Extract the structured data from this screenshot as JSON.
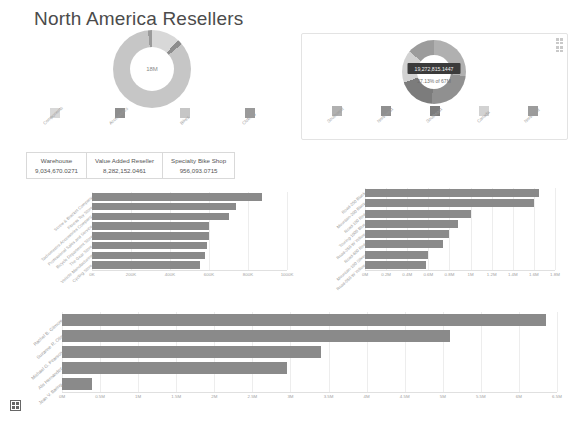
{
  "page": {
    "title": "North America Resellers",
    "background": "#ffffff"
  },
  "colors": {
    "bar": "#8a8a8a",
    "bar_light": "#b9b9b9",
    "donut_main": "#bdbdbd",
    "donut_accent": "#8a8a8a",
    "tooltip_bg": "#3b3b3b",
    "text": "#5a5a5a",
    "muted": "#9b9b9b",
    "grid": "#ededed"
  },
  "left_donut": {
    "center_label": "18M",
    "legend": [
      {
        "label": "Components",
        "color": "#d8d8d8"
      },
      {
        "label": "Accessories",
        "color": "#8e8e8e"
      },
      {
        "label": "Bikes",
        "color": "#c6c6c6"
      },
      {
        "label": "Clothing",
        "color": "#9a9a9a"
      }
    ],
    "chart_data": {
      "type": "pie",
      "title": "",
      "categories": [
        "Components",
        "Accessories",
        "Bikes",
        "Clothing"
      ],
      "values": [
        2.1,
        0.4,
        15.2,
        0.3
      ],
      "center_total": "18M",
      "legend_position": "bottom"
    }
  },
  "right_panel": {
    "tooltip_value": "19,272,815.1447",
    "tooltip_sub": "27.13% of 67M",
    "corner_icons": [
      "grid-icon",
      "grid-icon"
    ],
    "legend": [
      {
        "label": "Southwest",
        "color": "#b0b0b0"
      },
      {
        "label": "Northwest",
        "color": "#909090"
      },
      {
        "label": "Southeast",
        "color": "#7c7c7c"
      },
      {
        "label": "Canada",
        "color": "#d2d2d2"
      },
      {
        "label": "Northeast",
        "color": "#9c9c9c"
      }
    ],
    "chart_data": {
      "type": "pie",
      "title": "",
      "categories": [
        "Southwest",
        "Northwest",
        "Southeast",
        "Canada",
        "Northeast"
      ],
      "values": [
        27.13,
        24.0,
        18.5,
        16.4,
        13.97
      ],
      "value_unit": "%",
      "highlighted": "Southwest",
      "highlighted_value": "19,272,815.1447",
      "highlighted_share": "27.13% of 67M",
      "legend_position": "bottom"
    }
  },
  "kpi_cards": [
    {
      "label": "Warehouse",
      "value": "9,034,670.0271"
    },
    {
      "label": "Value Added Reseller",
      "value": "8,282,152.0461"
    },
    {
      "label": "Specialty Bike Shop",
      "value": "956,093.0715"
    }
  ],
  "chart_data": [
    {
      "id": "resellers-by-sales",
      "type": "bar",
      "orientation": "horizontal",
      "title": "",
      "xlabel": "",
      "ylabel": "",
      "categories": [
        "Screw & Bracket Company",
        "Fitness Toy Store",
        "Tachometers Accessories Company",
        "Professional Sales and Service",
        "Bicycle Department Store",
        "The Gear Store",
        "Vehicle Manufacturing",
        "Cycling Store"
      ],
      "values": [
        870000,
        740000,
        700000,
        600000,
        600000,
        590000,
        580000,
        555000
      ],
      "xlim": [
        0,
        1000000
      ],
      "xticks": [
        0,
        200000,
        400000,
        600000,
        800000,
        1000000
      ],
      "xticklabels": [
        "0K",
        "200K",
        "400K",
        "600K",
        "800K",
        "1000K"
      ],
      "grid": true
    },
    {
      "id": "products-by-sales",
      "type": "bar",
      "orientation": "horizontal",
      "title": "",
      "xlabel": "",
      "ylabel": "",
      "categories": [
        "Road-250 Black",
        "Mountain-200 Black",
        "Road-150 Red",
        "Touring-1000 Blue",
        "Road-350-W Yellow",
        "Road-650 Red",
        "Mountain-100 Silver",
        "Road-550-W Yellow"
      ],
      "values": [
        1650000,
        1600000,
        1000000,
        880000,
        800000,
        740000,
        600000,
        580000
      ],
      "xlim": [
        0,
        1800000
      ],
      "xticks": [
        0,
        200000,
        400000,
        600000,
        800000,
        1000000,
        1200000,
        1400000,
        1600000,
        1800000
      ],
      "xticklabels": [
        "0M",
        "0.2M",
        "0.4M",
        "0.6M",
        "0.8M",
        "1M",
        "1.2M",
        "1.4M",
        "1.6M",
        "1.8M"
      ],
      "grid": true
    },
    {
      "id": "salespeople-by-sales",
      "type": "bar",
      "orientation": "horizontal",
      "title": "",
      "xlabel": "",
      "ylabel": "",
      "categories": [
        "Rachel B. Gilmore",
        "Suzanne R. Otis",
        "Michael G. Pearson",
        "Alis Hernandez",
        "Jean V. Baring"
      ],
      "values": [
        6350000,
        5100000,
        3400000,
        2950000,
        400000
      ],
      "xlim": [
        0,
        6500000
      ],
      "xticks": [
        0,
        500000,
        1000000,
        1500000,
        2000000,
        2500000,
        3000000,
        3500000,
        4000000,
        4500000,
        5000000,
        5500000,
        6000000,
        6500000
      ],
      "xticklabels": [
        "0M",
        "0.5M",
        "1M",
        "1.5M",
        "2M",
        "2.5M",
        "3M",
        "3.5M",
        "4M",
        "4.5M",
        "5M",
        "5.5M",
        "6M",
        "6.5M"
      ],
      "grid": true
    }
  ],
  "focus_icon": "table-grid-icon"
}
